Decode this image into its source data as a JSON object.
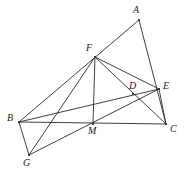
{
  "figure": {
    "stroke_color": "#2b2b2b",
    "background_color": "#ffffff",
    "width": 192,
    "height": 176
  },
  "points": {
    "A": {
      "label": "A",
      "x": 139,
      "y": 20,
      "label_x": 133,
      "label_y": 5
    },
    "B": {
      "label": "B",
      "x": 19,
      "y": 122,
      "label_x": 7,
      "label_y": 113
    },
    "C": {
      "label": "C",
      "x": 166,
      "y": 124,
      "label_x": 170,
      "label_y": 124
    },
    "D": {
      "label": "D",
      "x": 133,
      "y": 94,
      "label_x": 129,
      "label_y": 81
    },
    "E": {
      "label": "E",
      "x": 159,
      "y": 89,
      "label_x": 163,
      "label_y": 81
    },
    "F": {
      "label": "F",
      "x": 95,
      "y": 57,
      "label_x": 86,
      "label_y": 43
    },
    "G": {
      "label": "G",
      "x": 29,
      "y": 155,
      "label_x": 23,
      "label_y": 158
    },
    "M": {
      "label": "M",
      "x": 93,
      "y": 124,
      "label_x": 88,
      "label_y": 126
    }
  },
  "segments": [
    {
      "name": "segment-A-F-B",
      "from": "A",
      "to": "B"
    },
    {
      "name": "segment-A-E-C",
      "from": "A",
      "to": "C"
    },
    {
      "name": "segment-B-M-C",
      "from": "B",
      "to": "C"
    },
    {
      "name": "segment-F-M",
      "from": "F",
      "to": "M"
    },
    {
      "name": "segment-F-G",
      "from": "F",
      "to": "G"
    },
    {
      "name": "segment-F-D-C",
      "from": "F",
      "to": "C"
    },
    {
      "name": "segment-F-E",
      "from": "F",
      "to": "E"
    },
    {
      "name": "segment-B-D-E",
      "from": "B",
      "to": "E"
    },
    {
      "name": "segment-B-G",
      "from": "B",
      "to": "G"
    },
    {
      "name": "segment-G-E",
      "from": "G",
      "to": "E"
    },
    {
      "name": "segment-E-C",
      "from": "E",
      "to": "C"
    }
  ],
  "vertex_dot_radius": 1.1
}
